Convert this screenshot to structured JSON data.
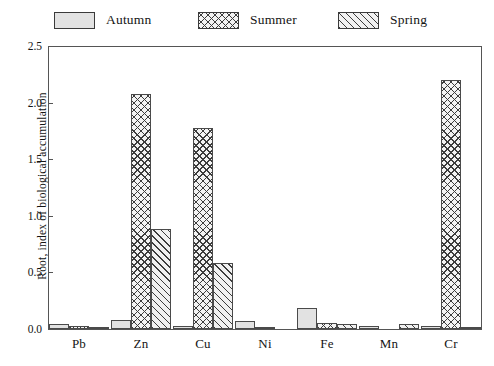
{
  "chart_data": {
    "type": "bar",
    "title": "",
    "subtitle": "",
    "xlabel": "",
    "ylabel": "Root, index of biological accumulation",
    "categories": [
      "Pb",
      "Zn",
      "Cu",
      "Ni",
      "Fe",
      "Mn",
      "Cr"
    ],
    "series": [
      {
        "name": "Autumn",
        "pattern": "solid",
        "values": [
          0.04,
          0.08,
          0.03,
          0.07,
          0.19,
          0.03,
          0.03
        ]
      },
      {
        "name": "Summer",
        "pattern": "cross-hatch",
        "values": [
          0.03,
          2.08,
          1.78,
          0.01,
          0.05,
          0.0,
          2.2
        ]
      },
      {
        "name": "Spring",
        "pattern": "diagonal-hatch",
        "values": [
          0.02,
          0.88,
          0.58,
          0.0,
          0.04,
          0.04,
          0.02
        ]
      }
    ],
    "ylim": [
      0.0,
      2.5
    ],
    "ytick_values": [
      0.0,
      0.5,
      1.0,
      1.5,
      2.0,
      2.5
    ],
    "ytick_labels": [
      "0.0",
      "0.5",
      "1.0",
      "1.5",
      "2.0",
      "2.5"
    ],
    "grid": false,
    "legend_position": "top",
    "frame": "box",
    "colors": {
      "autumn_fill": "#e2e2e2",
      "summer_fill": "#f3f3f3",
      "spring_fill": "#f1f1f1",
      "bar_border": "#4a4a4a",
      "axis": "#555555",
      "text": "#141414",
      "background": "#ffffff"
    }
  }
}
